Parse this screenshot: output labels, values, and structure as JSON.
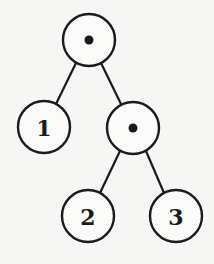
{
  "diagram": {
    "type": "binary-tree",
    "nodes": [
      {
        "id": "root",
        "kind": "internal",
        "label": "•"
      },
      {
        "id": "leaf1",
        "kind": "leaf",
        "label": "1"
      },
      {
        "id": "inner",
        "kind": "internal",
        "label": "•"
      },
      {
        "id": "leaf2",
        "kind": "leaf",
        "label": "2"
      },
      {
        "id": "leaf3",
        "kind": "leaf",
        "label": "3"
      }
    ],
    "edges": [
      {
        "from": "root",
        "to": "leaf1"
      },
      {
        "from": "root",
        "to": "inner"
      },
      {
        "from": "inner",
        "to": "leaf2"
      },
      {
        "from": "inner",
        "to": "leaf3"
      }
    ]
  }
}
